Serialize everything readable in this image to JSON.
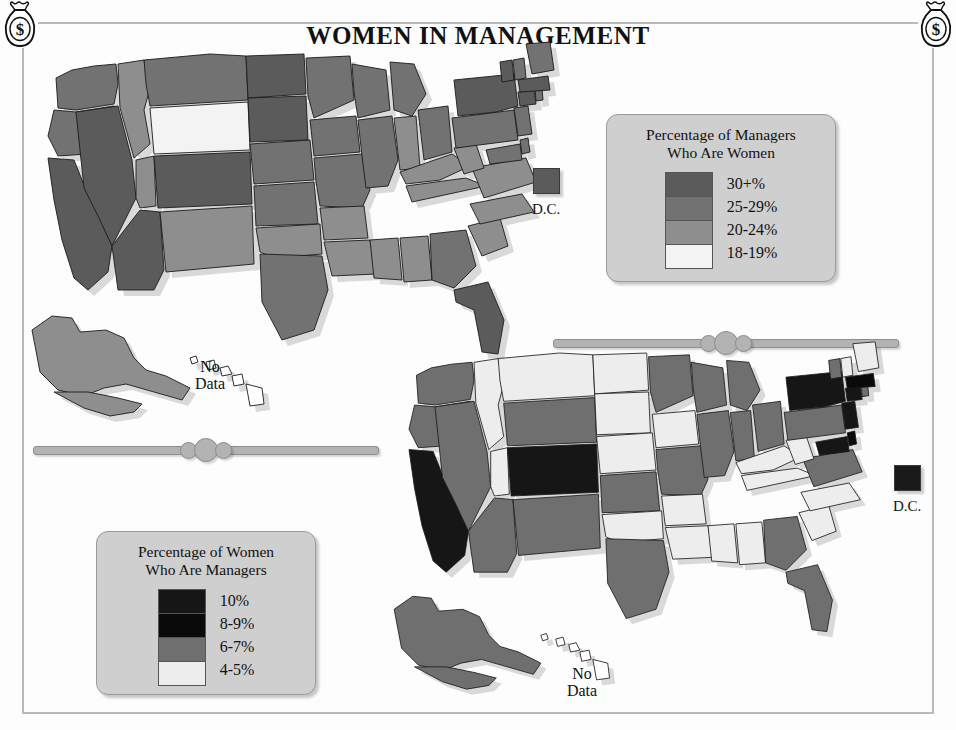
{
  "title": "WOMEN IN MANAGEMENT",
  "ornaments": {
    "corner_top_left": "money-bag-icon",
    "corner_top_right": "money-bag-icon",
    "divider_left": "bar-and-beads-divider",
    "divider_right": "bar-and-beads-divider"
  },
  "legend_top": {
    "title_line1": "Percentage of Managers",
    "title_line2": "Who Are Women",
    "entries": [
      {
        "label": "30+%",
        "color": "#5b5b5b"
      },
      {
        "label": "25-29%",
        "color": "#727272"
      },
      {
        "label": "20-24%",
        "color": "#8e8e8e"
      },
      {
        "label": "18-19%",
        "color": "#f3f3f3"
      }
    ]
  },
  "legend_bottom": {
    "title_line1": "Percentage of Women",
    "title_line2": "Who Are Managers",
    "entries": [
      {
        "label": "10%",
        "color": "#161616"
      },
      {
        "label": "8-9%",
        "color": "#0a0a0a"
      },
      {
        "label": "6-7%",
        "color": "#6f6f6f"
      },
      {
        "label": "4-5%",
        "color": "#ededed"
      }
    ]
  },
  "dc_top": {
    "label": "D.C.",
    "color": "#5b5b5b"
  },
  "dc_bottom": {
    "label": "D.C.",
    "color": "#1a1a1a"
  },
  "nodata_top": {
    "line1": "No",
    "line2": "Data"
  },
  "nodata_bottom": {
    "line1": "No",
    "line2": "Data"
  },
  "chart_data": {
    "type": "map",
    "title": "WOMEN IN MANAGEMENT",
    "maps": [
      {
        "name": "Percentage of Managers Who Are Women",
        "legend_bins": [
          "30+%",
          "25-29%",
          "20-24%",
          "18-19%"
        ],
        "bin_colors": [
          "#5b5b5b",
          "#727272",
          "#8e8e8e",
          "#f3f3f3"
        ],
        "special": {
          "DC": "30+%",
          "HI": "No Data"
        },
        "values": {
          "WA": "25-29%",
          "OR": "25-29%",
          "CA": "30+%",
          "NV": "30+%",
          "ID": "20-24%",
          "MT": "25-29%",
          "WY": "18-19%",
          "UT": "20-24%",
          "AZ": "30+%",
          "CO": "30+%",
          "NM": "20-24%",
          "ND": "30+%",
          "SD": "30+%",
          "NE": "25-29%",
          "KS": "25-29%",
          "OK": "20-24%",
          "TX": "25-29%",
          "MN": "25-29%",
          "IA": "25-29%",
          "MO": "25-29%",
          "AR": "20-24%",
          "LA": "20-24%",
          "WI": "25-29%",
          "IL": "25-29%",
          "MI": "25-29%",
          "IN": "20-24%",
          "OH": "25-29%",
          "KY": "20-24%",
          "TN": "20-24%",
          "MS": "20-24%",
          "AL": "20-24%",
          "GA": "25-29%",
          "FL": "30+%",
          "SC": "20-24%",
          "NC": "20-24%",
          "VA": "20-24%",
          "WV": "20-24%",
          "MD": "25-29%",
          "DE": "25-29%",
          "PA": "25-29%",
          "NJ": "25-29%",
          "NY": "30+%",
          "CT": "30+%",
          "RI": "25-29%",
          "MA": "30+%",
          "VT": "30+%",
          "NH": "25-29%",
          "ME": "25-29%",
          "AK": "20-24%"
        }
      },
      {
        "name": "Percentage of Women Who Are Managers",
        "legend_bins": [
          "10%",
          "8-9%",
          "6-7%",
          "4-5%"
        ],
        "bin_colors": [
          "#161616",
          "#0a0a0a",
          "#6f6f6f",
          "#ededed"
        ],
        "special": {
          "DC": "10%",
          "HI": "No Data"
        },
        "values": {
          "WA": "6-7%",
          "OR": "6-7%",
          "CA": "10%",
          "NV": "6-7%",
          "ID": "4-5%",
          "MT": "4-5%",
          "WY": "6-7%",
          "UT": "4-5%",
          "AZ": "6-7%",
          "CO": "10%",
          "NM": "6-7%",
          "ND": "4-5%",
          "SD": "4-5%",
          "NE": "4-5%",
          "KS": "6-7%",
          "OK": "4-5%",
          "TX": "6-7%",
          "MN": "6-7%",
          "IA": "4-5%",
          "MO": "6-7%",
          "AR": "4-5%",
          "LA": "4-5%",
          "WI": "6-7%",
          "IL": "6-7%",
          "MI": "6-7%",
          "IN": "6-7%",
          "OH": "6-7%",
          "KY": "4-5%",
          "TN": "4-5%",
          "MS": "4-5%",
          "AL": "4-5%",
          "GA": "6-7%",
          "FL": "6-7%",
          "SC": "4-5%",
          "NC": "4-5%",
          "VA": "6-7%",
          "WV": "4-5%",
          "MD": "10%",
          "DE": "8-9%",
          "PA": "6-7%",
          "NJ": "10%",
          "NY": "10%",
          "CT": "10%",
          "RI": "6-7%",
          "MA": "8-9%",
          "VT": "6-7%",
          "NH": "4-5%",
          "ME": "4-5%",
          "AK": "6-7%"
        }
      }
    ]
  }
}
